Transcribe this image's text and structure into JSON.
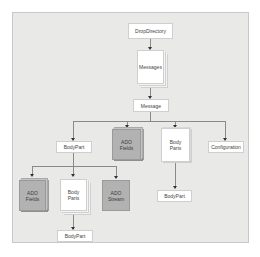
{
  "diagram": {
    "nodes": {
      "drop_directory": "DropDirectory",
      "messages": "Messages",
      "message": "Message",
      "bodypart_1": "BodyPart",
      "ado_fields_1": "ADO\nFields",
      "body_parts_1": "Body\nParts",
      "configuration": "Configuration",
      "ado_fields_2": "ADO\nFields",
      "body_parts_2": "Body\nParts",
      "ado_stream": "ADO\nStream",
      "bodypart_2": "BodyPart",
      "bodypart_3": "BodyPart"
    },
    "edges": [
      [
        "DropDirectory",
        "Messages"
      ],
      [
        "Messages",
        "Message"
      ],
      [
        "Message",
        "BodyPart"
      ],
      [
        "Message",
        "ADO Fields"
      ],
      [
        "Message",
        "Body Parts"
      ],
      [
        "Message",
        "Configuration"
      ],
      [
        "BodyPart",
        "ADO Fields"
      ],
      [
        "BodyPart",
        "Body Parts"
      ],
      [
        "BodyPart",
        "ADO Stream"
      ],
      [
        "Body Parts",
        "BodyPart"
      ],
      [
        "Body Parts",
        "BodyPart"
      ]
    ],
    "colors": {
      "background": "#e9e9e8",
      "plain_node": "#ffffff",
      "ado_node": "#b2b2b2",
      "connector": "#8a8a8a"
    }
  }
}
